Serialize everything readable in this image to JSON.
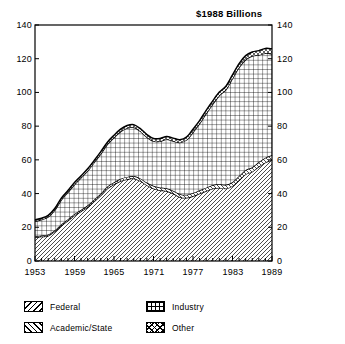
{
  "chart_data": {
    "type": "area",
    "title": "$1988 Billions",
    "subtitle": "",
    "xlabel": "",
    "ylabel": "",
    "stacked": true,
    "grid": false,
    "legend_position": "bottom",
    "xlim": [
      1953,
      1989
    ],
    "ylim": [
      0,
      140
    ],
    "ytick_values": [
      0,
      20,
      40,
      60,
      80,
      100,
      120,
      140
    ],
    "ytick_labels": [
      "0",
      "20",
      "40",
      "60",
      "80",
      "100",
      "120",
      "140"
    ],
    "ytick_labels_right": [
      "0",
      "20",
      "40",
      "60",
      "80",
      "100",
      "120",
      "140"
    ],
    "xtick_values": [
      1953,
      1959,
      1965,
      1971,
      1977,
      1983,
      1989
    ],
    "xtick_labels": [
      "1953",
      "1959",
      "1965",
      "1971",
      "1977",
      "1983",
      "1989"
    ],
    "x": [
      1953,
      1954,
      1955,
      1956,
      1957,
      1958,
      1959,
      1960,
      1961,
      1962,
      1963,
      1964,
      1965,
      1966,
      1967,
      1968,
      1969,
      1970,
      1971,
      1972,
      1973,
      1974,
      1975,
      1976,
      1977,
      1978,
      1979,
      1980,
      1981,
      1982,
      1983,
      1984,
      1985,
      1986,
      1987,
      1988,
      1989
    ],
    "series": [
      {
        "name": "Federal",
        "pattern": "diagonal-hatch-forward",
        "values": [
          14.0,
          14.5,
          15.0,
          17.5,
          21.0,
          24.0,
          27.0,
          29.5,
          32.0,
          35.5,
          39.0,
          43.0,
          45.5,
          47.5,
          48.5,
          49.0,
          47.5,
          45.0,
          43.0,
          42.0,
          41.5,
          40.0,
          38.0,
          37.5,
          38.5,
          40.0,
          41.5,
          43.0,
          43.5,
          43.0,
          44.5,
          48.0,
          51.5,
          53.0,
          56.0,
          58.5,
          60.0
        ]
      },
      {
        "name": "Academic/State",
        "pattern": "diagonal-hatch-back",
        "values": [
          0.6,
          0.6,
          0.7,
          0.7,
          0.8,
          0.8,
          0.9,
          0.9,
          1.0,
          1.0,
          1.1,
          1.2,
          1.2,
          1.3,
          1.4,
          1.4,
          1.5,
          1.5,
          1.6,
          1.6,
          1.7,
          1.7,
          1.8,
          1.8,
          1.9,
          2.0,
          2.0,
          2.1,
          2.2,
          2.2,
          2.3,
          2.4,
          2.5,
          2.6,
          2.7,
          2.8,
          2.9
        ]
      },
      {
        "name": "Industry",
        "pattern": "grid-crosshatch",
        "values": [
          9.0,
          9.5,
          10.5,
          12.0,
          14.5,
          16.0,
          17.5,
          19.0,
          20.5,
          22.0,
          23.5,
          25.0,
          26.5,
          28.0,
          29.0,
          29.0,
          28.0,
          27.0,
          26.5,
          27.5,
          29.0,
          29.5,
          30.5,
          32.5,
          36.0,
          39.5,
          44.0,
          48.0,
          52.5,
          56.5,
          61.5,
          64.5,
          65.5,
          66.0,
          63.5,
          62.0,
          60.0
        ]
      },
      {
        "name": "Other",
        "pattern": "diagonal-crosshatch",
        "values": [
          0.8,
          0.8,
          0.9,
          0.9,
          1.0,
          1.0,
          1.1,
          1.1,
          1.2,
          1.2,
          1.3,
          1.3,
          1.4,
          1.4,
          1.5,
          1.5,
          1.5,
          1.5,
          1.6,
          1.6,
          1.6,
          1.7,
          1.7,
          1.7,
          1.8,
          1.8,
          1.9,
          1.9,
          2.0,
          2.0,
          2.1,
          2.2,
          2.3,
          2.4,
          2.6,
          2.8,
          3.0
        ]
      }
    ],
    "totals": [
      24.4,
      25.4,
      27.1,
      31.1,
      37.3,
      41.8,
      46.5,
      50.5,
      54.7,
      59.7,
      64.9,
      70.5,
      74.6,
      78.2,
      80.4,
      80.9,
      78.5,
      75.0,
      72.7,
      72.7,
      73.8,
      72.9,
      72.0,
      73.5,
      78.2,
      83.3,
      89.4,
      95.0,
      100.2,
      103.7,
      110.4,
      117.1,
      121.8,
      124.0,
      124.8,
      126.1,
      125.9
    ]
  },
  "legend": {
    "entries": [
      {
        "label": "Federal",
        "swatch": "federal-swatch"
      },
      {
        "label": "Industry",
        "swatch": "industry-swatch"
      },
      {
        "label": "Academic/State",
        "swatch": "academic-state-swatch"
      },
      {
        "label": "Other",
        "swatch": "other-swatch"
      }
    ]
  }
}
